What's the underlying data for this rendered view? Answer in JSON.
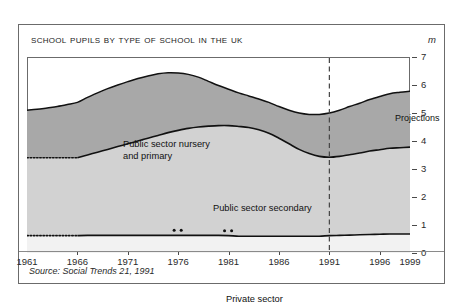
{
  "figure": {
    "title": "School Pupils By Type of School in the UK",
    "unit_label": "m",
    "source": "Source: Social Trends 21, 1991"
  },
  "annotations": {
    "nursery_line1": "Public sector nursery",
    "nursery_line2": "and primary",
    "secondary": "Public sector secondary",
    "private": "Private sector",
    "projections": "Projections"
  },
  "colors": {
    "nursery_primary": "#a8a8a8",
    "secondary": "#d2d2d2",
    "private": "#f2f2f2",
    "line": "#111111",
    "frame": "#6b6b6b",
    "background": "#ffffff"
  },
  "chart_data": {
    "type": "area",
    "stacked": true,
    "title": "School Pupils By Type of School in the UK",
    "subtitle": "",
    "xlabel": "",
    "ylabel": "m",
    "ylim": [
      0,
      7
    ],
    "xlim": [
      1961,
      1999
    ],
    "yticks": [
      0,
      1,
      2,
      3,
      4,
      5,
      6,
      7
    ],
    "xticks": [
      1961,
      1966,
      1971,
      1976,
      1981,
      1986,
      1991,
      1996,
      1999
    ],
    "grid": false,
    "legend_position": "inline-labels",
    "projection_start": 1991,
    "projection_label": "Projections",
    "estimated_until": 1966,
    "series": [
      {
        "name": "Private sector",
        "order": 1,
        "values": [
          0.62,
          0.62,
          0.62,
          0.62,
          0.62,
          0.62,
          0.63,
          0.63,
          0.63,
          0.63,
          0.63,
          0.63,
          0.63,
          0.63,
          0.63,
          0.63,
          0.63,
          0.63,
          0.63,
          0.63,
          0.62,
          0.6,
          0.6,
          0.6,
          0.6,
          0.6,
          0.6,
          0.6,
          0.6,
          0.6,
          0.62,
          0.63,
          0.64,
          0.65,
          0.66,
          0.67,
          0.68,
          0.68,
          0.68
        ]
      },
      {
        "name": "Public sector secondary",
        "order": 2,
        "values": [
          2.78,
          2.78,
          2.78,
          2.78,
          2.78,
          2.78,
          2.87,
          2.97,
          3.07,
          3.17,
          3.27,
          3.37,
          3.47,
          3.57,
          3.67,
          3.75,
          3.82,
          3.87,
          3.9,
          3.92,
          3.93,
          3.92,
          3.88,
          3.8,
          3.68,
          3.5,
          3.3,
          3.1,
          2.95,
          2.85,
          2.8,
          2.82,
          2.87,
          2.92,
          2.98,
          3.02,
          3.06,
          3.08,
          3.1
        ]
      },
      {
        "name": "Public sector nursery and primary",
        "order": 3,
        "values": [
          1.7,
          1.73,
          1.78,
          1.83,
          1.9,
          1.98,
          2.06,
          2.12,
          2.17,
          2.2,
          2.22,
          2.23,
          2.22,
          2.2,
          2.14,
          2.05,
          1.93,
          1.78,
          1.6,
          1.43,
          1.3,
          1.2,
          1.13,
          1.1,
          1.1,
          1.13,
          1.2,
          1.3,
          1.4,
          1.5,
          1.58,
          1.65,
          1.72,
          1.78,
          1.84,
          1.9,
          1.95,
          1.98,
          2.0
        ]
      }
    ],
    "x": [
      1961,
      1962,
      1963,
      1964,
      1965,
      1966,
      1967,
      1968,
      1969,
      1970,
      1971,
      1972,
      1973,
      1974,
      1975,
      1976,
      1977,
      1978,
      1979,
      1980,
      1981,
      1982,
      1983,
      1984,
      1985,
      1986,
      1987,
      1988,
      1989,
      1990,
      1991,
      1992,
      1993,
      1994,
      1995,
      1996,
      1997,
      1998,
      1999
    ],
    "totals": [
      5.1,
      5.13,
      5.18,
      5.23,
      5.3,
      5.38,
      5.56,
      5.72,
      5.87,
      6.0,
      6.12,
      6.23,
      6.32,
      6.4,
      6.44,
      6.43,
      6.38,
      6.28,
      6.13,
      5.98,
      5.85,
      5.72,
      5.61,
      5.5,
      5.38,
      5.23,
      5.1,
      5.0,
      4.95,
      4.95,
      5.0,
      5.1,
      5.23,
      5.35,
      5.48,
      5.59,
      5.69,
      5.74,
      5.78
    ]
  }
}
